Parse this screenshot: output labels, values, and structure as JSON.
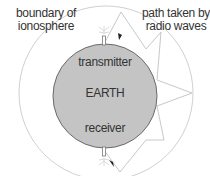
{
  "labels": {
    "ionosphere": "boundary of\nionosphere",
    "ionosphere_line1": "boundary of",
    "ionosphere_line2": "ionosphere",
    "path_line1": "path taken by",
    "path_line2": "radio waves",
    "transmitter": "transmitter",
    "earth": "EARTH",
    "receiver": "receiver"
  },
  "colors": {
    "earth_fill": "#c4c4c4",
    "earth_stroke": "#6a6a6a",
    "ionosphere_stroke": "#cfcfcf",
    "wave_stroke": "#c8c8c8",
    "text": "#333333"
  },
  "geometry": {
    "ionosphere": {
      "cx": 106,
      "cy": 93,
      "r": 87
    },
    "earth": {
      "cx": 105,
      "cy": 96,
      "r": 52
    },
    "wave_path": [
      [
        104,
        44
      ],
      [
        121,
        12
      ],
      [
        146,
        49
      ],
      [
        161,
        32
      ],
      [
        157,
        80
      ],
      [
        192,
        93
      ],
      [
        157,
        106
      ],
      [
        164,
        140
      ],
      [
        146,
        140
      ],
      [
        120,
        172
      ],
      [
        104,
        150
      ]
    ]
  }
}
